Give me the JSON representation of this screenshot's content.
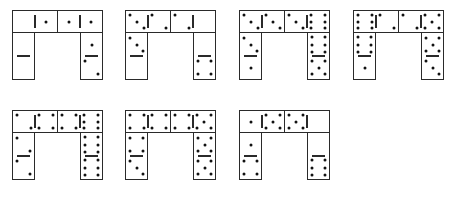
{
  "figure": {
    "colors": {
      "background": "#ffffff",
      "line": "#2a2a2a",
      "pip": "#111111"
    }
  },
  "puzzles": [
    {
      "id": 1,
      "top_left": [
        0,
        1
      ],
      "top_right": [
        1,
        1
      ],
      "left_vertical": [
        0,
        0
      ],
      "right_vertical": [
        1,
        2
      ]
    },
    {
      "id": 2,
      "top_left": [
        3,
        2
      ],
      "top_right": [
        2,
        0
      ],
      "left_vertical": [
        3,
        0
      ],
      "right_vertical": [
        0,
        4
      ]
    },
    {
      "id": 3,
      "top_left": [
        3,
        3
      ],
      "top_right": [
        3,
        6
      ],
      "left_vertical": [
        3,
        1
      ],
      "right_vertical": [
        6,
        5
      ]
    },
    {
      "id": 4,
      "top_left": [
        6,
        2
      ],
      "top_right": [
        2,
        5
      ],
      "left_vertical": [
        6,
        1
      ],
      "right_vertical": [
        5,
        3
      ]
    },
    {
      "id": 5,
      "top_left": [
        2,
        4
      ],
      "top_right": [
        4,
        6
      ],
      "left_vertical": [
        2,
        2
      ],
      "right_vertical": [
        6,
        6
      ]
    },
    {
      "id": 6,
      "top_left": [
        4,
        4
      ],
      "top_right": [
        4,
        5
      ],
      "left_vertical": [
        4,
        3
      ],
      "right_vertical": [
        5,
        5
      ]
    },
    {
      "id": 7,
      "top_left": [
        1,
        5
      ],
      "top_right": [
        5,
        0
      ],
      "left_vertical": [
        1,
        4
      ],
      "right_vertical": [
        0,
        6
      ]
    }
  ]
}
